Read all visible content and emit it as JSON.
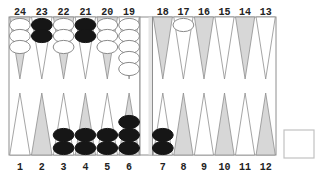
{
  "game": "backgammon",
  "colors": {
    "background": "#ffffff",
    "board_line": "#8e8e8e",
    "point_shaded_fill": "#d7d7d7",
    "point_plain_fill": "#ffffff",
    "bar_fill": "#ffffff",
    "bar_inner_shade": "#e6e6e6",
    "checker_white_fill": "#ffffff",
    "checker_outline": "#8a8a8a",
    "checker_black_fill": "#161616",
    "number_color": "#222222",
    "cube_box_stroke": "#c2c2c2"
  },
  "board": {
    "top_points": [
      {
        "label": "24",
        "shaded": true,
        "checkers": {
          "color": "white",
          "count": 3
        }
      },
      {
        "label": "23",
        "shaded": false,
        "checkers": {
          "color": "black",
          "count": 2
        }
      },
      {
        "label": "22",
        "shaded": true,
        "checkers": {
          "color": "white",
          "count": 3
        }
      },
      {
        "label": "21",
        "shaded": false,
        "checkers": {
          "color": "black",
          "count": 2
        }
      },
      {
        "label": "20",
        "shaded": true,
        "checkers": {
          "color": "white",
          "count": 3
        }
      },
      {
        "label": "19",
        "shaded": false,
        "checkers": {
          "color": "white",
          "count": 5
        }
      },
      {
        "label": "18",
        "shaded": true,
        "checkers": null
      },
      {
        "label": "17",
        "shaded": false,
        "checkers": {
          "color": "white",
          "count": 1
        }
      },
      {
        "label": "16",
        "shaded": true,
        "checkers": null
      },
      {
        "label": "15",
        "shaded": false,
        "checkers": null
      },
      {
        "label": "14",
        "shaded": true,
        "checkers": null
      },
      {
        "label": "13",
        "shaded": false,
        "checkers": null
      }
    ],
    "bottom_points": [
      {
        "label": "1",
        "shaded": false,
        "checkers": null
      },
      {
        "label": "2",
        "shaded": true,
        "checkers": null
      },
      {
        "label": "3",
        "shaded": false,
        "checkers": {
          "color": "black",
          "count": 2
        }
      },
      {
        "label": "4",
        "shaded": true,
        "checkers": {
          "color": "black",
          "count": 2
        }
      },
      {
        "label": "5",
        "shaded": false,
        "checkers": {
          "color": "black",
          "count": 2
        }
      },
      {
        "label": "6",
        "shaded": true,
        "checkers": {
          "color": "black",
          "count": 3
        }
      },
      {
        "label": "7",
        "shaded": false,
        "checkers": {
          "color": "black",
          "count": 2
        }
      },
      {
        "label": "8",
        "shaded": true,
        "checkers": null
      },
      {
        "label": "9",
        "shaded": false,
        "checkers": null
      },
      {
        "label": "10",
        "shaded": true,
        "checkers": null
      },
      {
        "label": "11",
        "shaded": false,
        "checkers": null
      },
      {
        "label": "12",
        "shaded": true,
        "checkers": null
      }
    ],
    "bar_checkers": 0
  },
  "side_box": {
    "visible": true,
    "label": ""
  }
}
